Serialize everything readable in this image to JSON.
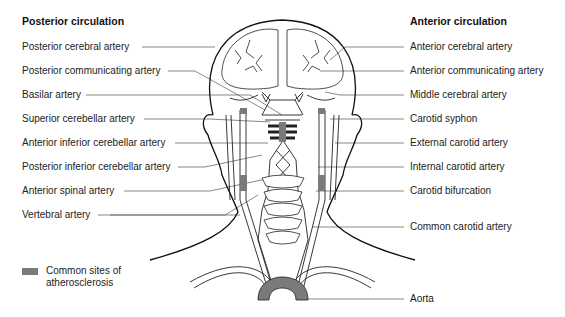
{
  "left": {
    "heading": "Posterior circulation",
    "labels": [
      {
        "text": "Posterior cerebral artery",
        "y": 42
      },
      {
        "text": "Posterior communicating artery",
        "y": 66
      },
      {
        "text": "Basilar artery",
        "y": 90
      },
      {
        "text": "Superior cerebellar artery",
        "y": 114
      },
      {
        "text": "Anterior inferior cerebellar artery",
        "y": 138
      },
      {
        "text": "Posterior inferior cerebellar artery",
        "y": 162
      },
      {
        "text": "Anterior spinal artery",
        "y": 186
      },
      {
        "text": "Vertebral artery",
        "y": 210
      }
    ]
  },
  "right": {
    "heading": "Anterior circulation",
    "labels": [
      {
        "text": "Anterior cerebral artery",
        "y": 42
      },
      {
        "text": "Anterior communicating artery",
        "y": 66
      },
      {
        "text": "Middle cerebral artery",
        "y": 90
      },
      {
        "text": "Carotid syphon",
        "y": 114
      },
      {
        "text": "External carotid artery",
        "y": 138
      },
      {
        "text": "Internal carotid artery",
        "y": 162
      },
      {
        "text": "Carotid bifurcation",
        "y": 186
      },
      {
        "text": "Common carotid artery",
        "y": 222
      },
      {
        "text": "Aorta",
        "y": 294
      }
    ]
  },
  "legend": {
    "line1": "Common sites of",
    "line2": "atherosclerosis",
    "swatch_color": "#7a7a7a"
  },
  "colors": {
    "line": "#222222",
    "leader": "#555555",
    "plaque": "#7a7a7a"
  }
}
